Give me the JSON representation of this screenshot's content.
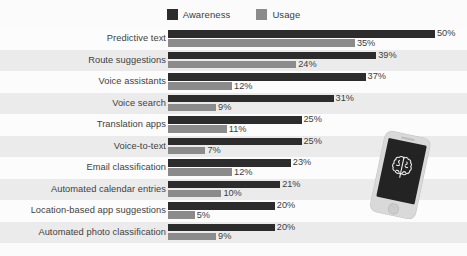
{
  "chart_data": {
    "type": "bar",
    "orientation": "horizontal",
    "title": "",
    "xlabel": "",
    "ylabel": "",
    "xlim": [
      0,
      50
    ],
    "grid": false,
    "legend_position": "top-center",
    "value_suffix": "%",
    "categories": [
      "Predictive text",
      "Route suggestions",
      "Voice assistants",
      "Voice search",
      "Translation apps",
      "Voice-to-text",
      "Email classification",
      "Automated calendar entries",
      "Location-based app suggestions",
      "Automated photo classification"
    ],
    "series": [
      {
        "name": "Awareness",
        "color": "#2c2c2c",
        "values": [
          50,
          39,
          37,
          31,
          25,
          25,
          23,
          21,
          20,
          20
        ],
        "labels": [
          "50%",
          "39%",
          "37%",
          "31%",
          "25%",
          "25%",
          "23%",
          "21%",
          "20%",
          "20%"
        ]
      },
      {
        "name": "Usage",
        "color": "#8b8b8b",
        "values": [
          35,
          24,
          12,
          9,
          11,
          7,
          12,
          10,
          5,
          9
        ],
        "labels": [
          "35%",
          "24%",
          "12%",
          "9%",
          "11%",
          "7%",
          "12%",
          "10%",
          "5%",
          "9%"
        ]
      }
    ]
  },
  "legend": {
    "entries": [
      {
        "label": "Awareness",
        "color": "#2c2c2c"
      },
      {
        "label": "Usage",
        "color": "#8b8b8b"
      }
    ]
  },
  "illustration": {
    "name": "smartphone-with-brain-icon",
    "device_color": "#d9d9d9",
    "screen_color": "#232323",
    "icon": "brain-icon"
  }
}
